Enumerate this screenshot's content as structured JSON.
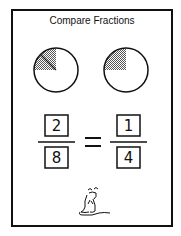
{
  "title": "Compare Fractions",
  "pies": [
    {
      "name": "left",
      "shaded_fraction": "2/8",
      "divisions_shown": 2
    },
    {
      "name": "right",
      "shaded_fraction": "1/4",
      "divisions_shown": 1
    }
  ],
  "equation": {
    "left": {
      "numerator": "2",
      "denominator": "8"
    },
    "operator": "=",
    "right": {
      "numerator": "1",
      "denominator": "4"
    }
  },
  "mascot": "mouse-icon"
}
